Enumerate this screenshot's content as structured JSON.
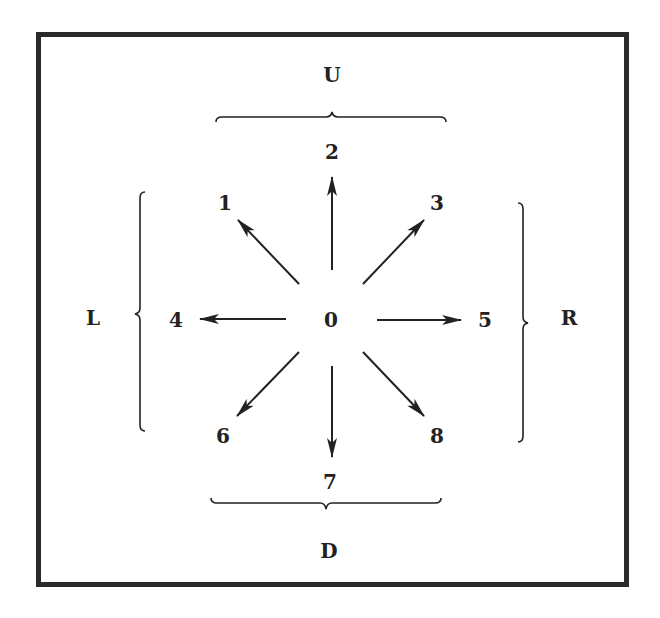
{
  "diagram": {
    "center": {
      "label": "0"
    },
    "groups": {
      "up": {
        "label": "U",
        "members": [
          "1",
          "2",
          "3"
        ]
      },
      "down": {
        "label": "D",
        "members": [
          "6",
          "7",
          "8"
        ]
      },
      "left": {
        "label": "L",
        "members": [
          "1",
          "4",
          "6"
        ]
      },
      "right": {
        "label": "R",
        "members": [
          "3",
          "5",
          "8"
        ]
      }
    },
    "directions": [
      {
        "id": "1",
        "label": "1",
        "direction": "up-left"
      },
      {
        "id": "2",
        "label": "2",
        "direction": "up"
      },
      {
        "id": "3",
        "label": "3",
        "direction": "up-right"
      },
      {
        "id": "4",
        "label": "4",
        "direction": "left"
      },
      {
        "id": "5",
        "label": "5",
        "direction": "right"
      },
      {
        "id": "6",
        "label": "6",
        "direction": "down-left"
      },
      {
        "id": "7",
        "label": "7",
        "direction": "down"
      },
      {
        "id": "8",
        "label": "8",
        "direction": "down-right"
      }
    ],
    "colors": {
      "ink": "#222222",
      "frame": "#2a2a2a",
      "background": "#ffffff"
    }
  }
}
